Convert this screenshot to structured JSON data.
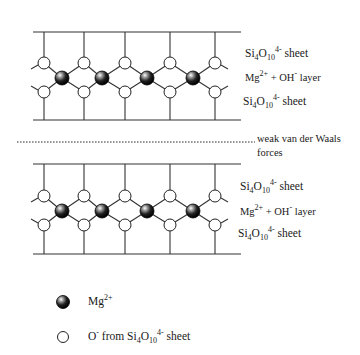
{
  "structures": [
    {
      "id": "top",
      "line_top_y": 32,
      "line_bottom_y": 120,
      "upper_o_y": 63,
      "mg_y": 78,
      "lower_o_y": 92,
      "labels": {
        "upper_sheet": {
          "base1": "Si",
          "sub1": "4",
          "base2": "O",
          "sub2": "10",
          "sup": "4-",
          "rest": " sheet"
        },
        "middle_layer": {
          "base1": "Mg",
          "sup1": "2+",
          "mid": " + OH",
          "sup2": "-",
          "rest": " layer"
        },
        "lower_sheet": {
          "base1": "Si",
          "sub1": "4",
          "base2": "O",
          "sub2": "10",
          "sup": "4-",
          "rest": " sheet"
        }
      }
    },
    {
      "id": "bottom",
      "line_top_y": 164,
      "line_bottom_y": 254,
      "upper_o_y": 196,
      "mg_y": 211,
      "lower_o_y": 225,
      "labels": {
        "upper_sheet": {
          "base1": "Si",
          "sub1": "4",
          "base2": "O",
          "sub2": "10",
          "sup": "4-",
          "rest": " sheet"
        },
        "middle_layer": {
          "base1": "Mg",
          "sup1": "2+",
          "mid": " + OH",
          "sup2": "-",
          "rest": " layer"
        },
        "lower_sheet": {
          "base1": "Si",
          "sub1": "4",
          "base2": "O",
          "sub2": "10",
          "sup": "4-",
          "rest": " sheet"
        }
      }
    }
  ],
  "separator": {
    "label_line1": "weak van der Waals",
    "label_line2": "forces",
    "y": 142
  },
  "legend": [
    {
      "icon": "mg-ion-filled-sphere",
      "base": "Mg",
      "sup": "2+",
      "rest": ""
    },
    {
      "icon": "oxygen-ion-open-circle",
      "base": "O",
      "sup": "-",
      "rest": " from Si",
      "sub1": "4",
      "base2": "O",
      "sub2": "10",
      "sup2": "4-",
      "rest2": " sheet"
    }
  ],
  "geometry": {
    "vertical_x": [
      44,
      84,
      125,
      170,
      215
    ],
    "mg_x": [
      62,
      102,
      147,
      193
    ],
    "line_x_start": 33,
    "line_x_end": 241
  }
}
